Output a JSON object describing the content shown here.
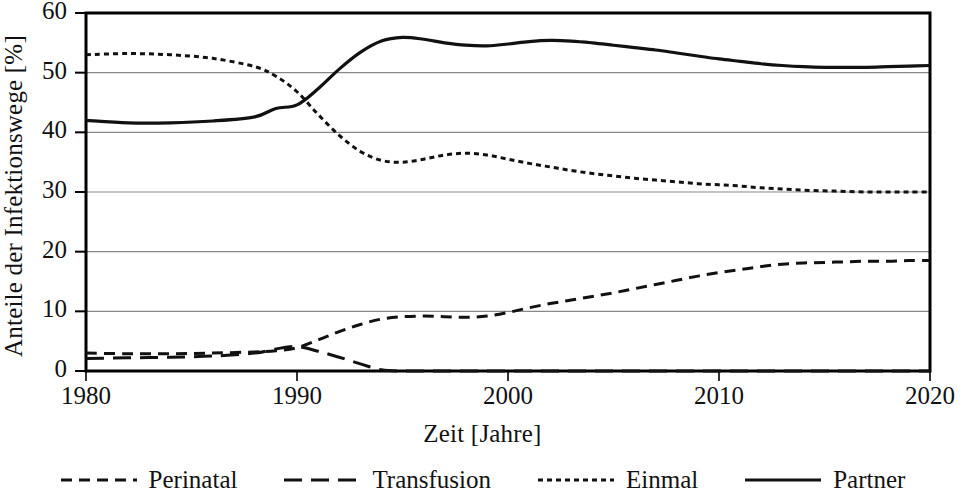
{
  "chart_data": {
    "type": "line",
    "title": "",
    "xlabel": "Zeit [Jahre]",
    "ylabel": "Anteile der Infektionswege [%]",
    "xlim": [
      1980,
      2020
    ],
    "ylim": [
      0,
      60
    ],
    "xticks": [
      1980,
      1990,
      2000,
      2010,
      2020
    ],
    "yticks": [
      0,
      10,
      20,
      30,
      40,
      50,
      60
    ],
    "grid": "horizontal",
    "legend_position": "bottom",
    "x": [
      1980,
      1982,
      1984,
      1986,
      1988,
      1989,
      1990,
      1991,
      1992,
      1993,
      1994,
      1995,
      1996,
      1997,
      1998,
      1999,
      2000,
      2001,
      2002,
      2003,
      2004,
      2005,
      2006,
      2007,
      2008,
      2009,
      2010,
      2011,
      2012,
      2013,
      2014,
      2015,
      2016,
      2017,
      2018,
      2019,
      2020
    ],
    "series": [
      {
        "name": "Perinatal",
        "style": "dashed",
        "values": [
          3.0,
          2.9,
          2.9,
          3.0,
          3.2,
          3.4,
          3.9,
          5.2,
          6.6,
          7.8,
          8.7,
          9.1,
          9.2,
          9.1,
          9.0,
          9.2,
          9.8,
          10.6,
          11.3,
          11.9,
          12.5,
          13.1,
          13.8,
          14.5,
          15.2,
          15.9,
          16.5,
          17.0,
          17.5,
          17.9,
          18.1,
          18.2,
          18.3,
          18.4,
          18.4,
          18.5,
          18.5
        ]
      },
      {
        "name": "Transfusion",
        "style": "long-dashed",
        "values": [
          2.1,
          2.2,
          2.3,
          2.5,
          3.0,
          3.7,
          4.1,
          3.3,
          2.3,
          1.2,
          0.2,
          0.0,
          0.0,
          0.0,
          0.0,
          0.0,
          0.0,
          0.0,
          0.0,
          0.0,
          0.0,
          0.0,
          0.0,
          0.0,
          0.0,
          0.0,
          0.0,
          0.0,
          0.0,
          0.0,
          0.0,
          0.0,
          0.0,
          0.0,
          0.0,
          0.0,
          0.0
        ]
      },
      {
        "name": "Einmal",
        "style": "dotted",
        "values": [
          53.0,
          53.2,
          53.0,
          52.4,
          51.0,
          49.4,
          46.8,
          43.0,
          39.5,
          36.8,
          35.3,
          35.0,
          35.5,
          36.2,
          36.5,
          36.2,
          35.5,
          34.8,
          34.2,
          33.6,
          33.1,
          32.7,
          32.3,
          32.0,
          31.7,
          31.4,
          31.2,
          31.0,
          30.7,
          30.5,
          30.3,
          30.2,
          30.1,
          30.0,
          30.0,
          30.0,
          30.0
        ]
      },
      {
        "name": "Partner",
        "style": "solid",
        "values": [
          42.0,
          41.6,
          41.6,
          41.9,
          42.6,
          44.0,
          44.6,
          47.3,
          50.6,
          53.4,
          55.3,
          55.9,
          55.6,
          55.0,
          54.6,
          54.5,
          54.8,
          55.2,
          55.4,
          55.3,
          55.0,
          54.6,
          54.2,
          53.8,
          53.3,
          52.8,
          52.3,
          51.9,
          51.5,
          51.2,
          51.0,
          50.9,
          50.9,
          50.9,
          51.0,
          51.1,
          51.2
        ]
      }
    ]
  },
  "legend": {
    "items": [
      {
        "label": "Perinatal",
        "style": "dashed"
      },
      {
        "label": "Transfusion",
        "style": "long-dashed"
      },
      {
        "label": "Einmal",
        "style": "dotted"
      },
      {
        "label": "Partner",
        "style": "solid"
      }
    ]
  },
  "colors": {
    "line": "#111111",
    "grid": "#888888",
    "axis": "#000000",
    "background": "#ffffff"
  }
}
